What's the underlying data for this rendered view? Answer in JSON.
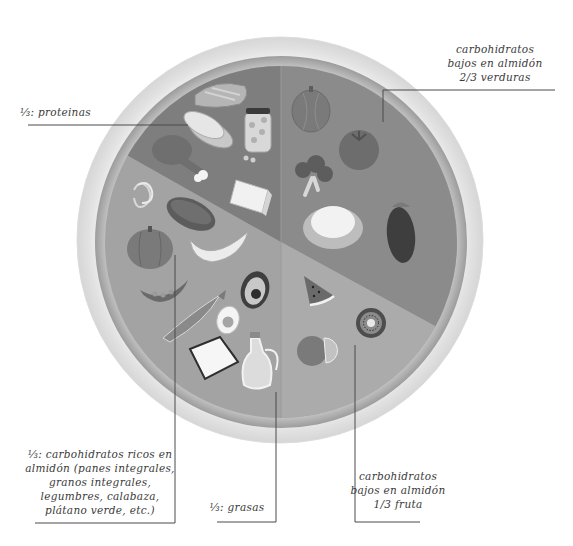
{
  "diagram": {
    "type": "plate-diagram",
    "colors": {
      "background": "#ffffff",
      "plate_outer": "#f4f4f4",
      "plate_rim": "#c9c9c9",
      "section_proteins": "#7e7e7e",
      "section_vegetables": "#8a8a8a",
      "section_starch_fats": "#a3a3a3",
      "section_fruit": "#a9a9a9",
      "leader_line": "#4a4a4a",
      "text": "#3a3a3a"
    },
    "sections": [
      {
        "id": "proteins",
        "label": "⅓: proteinas",
        "foods": [
          "salmon",
          "sliced cheese/fish",
          "chicken drumstick",
          "jar of chickpeas",
          "butter block"
        ]
      },
      {
        "id": "vegetables",
        "label": "carbohidratos\nbajos en almidón\n2/3 verduras",
        "foods": [
          "squash",
          "tomato",
          "broccoli",
          "cauliflower",
          "eggplant"
        ]
      },
      {
        "id": "starches",
        "label": "⅓: carbohidratos ricos en\nalmidón (panes integrales,\ngranos integrales,\nlegumbres, calabaza,\nplátano verde, etc.)",
        "foods": [
          "pasta",
          "bread loaf",
          "pumpkin",
          "banana",
          "pea pod"
        ]
      },
      {
        "id": "fats",
        "label": "⅓: grasas",
        "foods": [
          "avocado",
          "sardine",
          "boiled egg",
          "cheese wedge",
          "olive oil jug"
        ]
      },
      {
        "id": "fruit",
        "label": "carbohidratos\nbajos en almidón\n1/3 fruta",
        "foods": [
          "watermelon slice",
          "kiwi",
          "orange"
        ]
      }
    ]
  }
}
